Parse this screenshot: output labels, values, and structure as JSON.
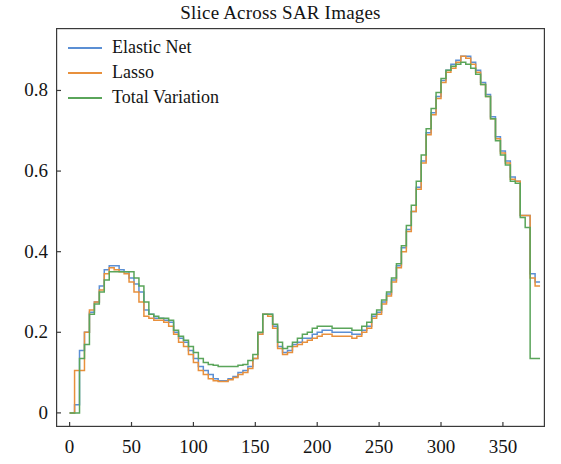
{
  "chart_data": {
    "type": "line",
    "title": "Slice Across SAR Images",
    "xlabel": "",
    "ylabel": "",
    "xlim": [
      -11,
      384
    ],
    "ylim": [
      -0.035,
      0.955
    ],
    "grid": false,
    "drawstyle": "steps-post",
    "legend_position": "upper left",
    "xticks": [
      0,
      50,
      100,
      150,
      200,
      250,
      300,
      350
    ],
    "xtick_labels": [
      "0",
      "50",
      "100",
      "150",
      "200",
      "250",
      "300",
      "350"
    ],
    "yticks": [
      0,
      0.2,
      0.4,
      0.6,
      0.8
    ],
    "ytick_labels": [
      "0",
      "0.2",
      "0.4",
      "0.6",
      "0.8"
    ],
    "colors": {
      "elastic_net": "#5b8fd4",
      "lasso": "#e8903c",
      "total_variation": "#5aa55a",
      "axis": "#3a3a3a",
      "text": "#141414"
    },
    "x": [
      0,
      4,
      8,
      12,
      16,
      20,
      24,
      28,
      32,
      36,
      40,
      44,
      48,
      52,
      56,
      60,
      64,
      68,
      72,
      76,
      80,
      84,
      88,
      92,
      96,
      100,
      104,
      108,
      112,
      116,
      120,
      124,
      128,
      132,
      136,
      140,
      144,
      148,
      152,
      156,
      160,
      164,
      168,
      172,
      176,
      180,
      184,
      188,
      192,
      196,
      200,
      204,
      208,
      212,
      216,
      220,
      224,
      228,
      232,
      236,
      240,
      244,
      248,
      252,
      256,
      260,
      264,
      268,
      272,
      276,
      280,
      284,
      288,
      292,
      296,
      300,
      304,
      308,
      312,
      316,
      320,
      324,
      328,
      332,
      336,
      340,
      344,
      348,
      352,
      356,
      360,
      364,
      368,
      372,
      376
    ],
    "series": [
      {
        "name": "Elastic Net",
        "color": "#5b8fd4",
        "values": [
          0.0,
          0.02,
          0.155,
          0.2,
          0.25,
          0.275,
          0.315,
          0.355,
          0.365,
          0.365,
          0.355,
          0.35,
          0.335,
          0.32,
          0.3,
          0.255,
          0.245,
          0.235,
          0.235,
          0.23,
          0.225,
          0.2,
          0.185,
          0.175,
          0.155,
          0.135,
          0.115,
          0.105,
          0.095,
          0.085,
          0.08,
          0.08,
          0.085,
          0.09,
          0.1,
          0.105,
          0.115,
          0.135,
          0.195,
          0.245,
          0.245,
          0.215,
          0.165,
          0.15,
          0.155,
          0.17,
          0.175,
          0.185,
          0.185,
          0.195,
          0.2,
          0.205,
          0.205,
          0.2,
          0.2,
          0.2,
          0.2,
          0.195,
          0.195,
          0.205,
          0.215,
          0.24,
          0.25,
          0.275,
          0.295,
          0.33,
          0.365,
          0.41,
          0.455,
          0.5,
          0.56,
          0.625,
          0.695,
          0.745,
          0.785,
          0.825,
          0.85,
          0.865,
          0.875,
          0.885,
          0.885,
          0.87,
          0.85,
          0.82,
          0.79,
          0.735,
          0.685,
          0.65,
          0.625,
          0.585,
          0.575,
          0.49,
          0.49,
          0.345,
          0.325
        ]
      },
      {
        "name": "Lasso",
        "color": "#e8903c",
        "values": [
          0.0,
          0.105,
          0.105,
          0.2,
          0.255,
          0.275,
          0.305,
          0.345,
          0.36,
          0.355,
          0.35,
          0.345,
          0.325,
          0.3,
          0.275,
          0.24,
          0.235,
          0.23,
          0.23,
          0.225,
          0.215,
          0.195,
          0.175,
          0.165,
          0.145,
          0.125,
          0.105,
          0.095,
          0.085,
          0.08,
          0.078,
          0.078,
          0.082,
          0.088,
          0.095,
          0.1,
          0.11,
          0.135,
          0.195,
          0.245,
          0.24,
          0.21,
          0.16,
          0.145,
          0.15,
          0.165,
          0.17,
          0.175,
          0.18,
          0.185,
          0.19,
          0.195,
          0.195,
          0.19,
          0.19,
          0.19,
          0.19,
          0.185,
          0.19,
          0.2,
          0.21,
          0.235,
          0.245,
          0.27,
          0.29,
          0.325,
          0.36,
          0.4,
          0.45,
          0.5,
          0.555,
          0.62,
          0.69,
          0.74,
          0.78,
          0.82,
          0.845,
          0.855,
          0.87,
          0.885,
          0.88,
          0.865,
          0.845,
          0.815,
          0.785,
          0.73,
          0.68,
          0.645,
          0.62,
          0.58,
          0.575,
          0.49,
          0.49,
          0.335,
          0.315
        ]
      },
      {
        "name": "Total Variation",
        "color": "#5aa55a",
        "values": [
          0.0,
          0.0,
          0.135,
          0.17,
          0.245,
          0.27,
          0.3,
          0.33,
          0.35,
          0.35,
          0.35,
          0.35,
          0.35,
          0.335,
          0.315,
          0.275,
          0.245,
          0.24,
          0.235,
          0.235,
          0.23,
          0.205,
          0.19,
          0.18,
          0.165,
          0.15,
          0.135,
          0.125,
          0.12,
          0.118,
          0.115,
          0.115,
          0.115,
          0.115,
          0.118,
          0.12,
          0.13,
          0.145,
          0.2,
          0.245,
          0.245,
          0.22,
          0.175,
          0.16,
          0.165,
          0.175,
          0.185,
          0.195,
          0.2,
          0.21,
          0.215,
          0.215,
          0.215,
          0.21,
          0.21,
          0.21,
          0.21,
          0.205,
          0.205,
          0.215,
          0.225,
          0.245,
          0.255,
          0.28,
          0.3,
          0.335,
          0.37,
          0.415,
          0.465,
          0.515,
          0.575,
          0.64,
          0.705,
          0.755,
          0.795,
          0.83,
          0.85,
          0.86,
          0.865,
          0.87,
          0.865,
          0.855,
          0.84,
          0.815,
          0.785,
          0.73,
          0.675,
          0.64,
          0.615,
          0.575,
          0.57,
          0.485,
          0.46,
          0.135,
          0.135
        ]
      }
    ]
  },
  "legend": {
    "items": [
      {
        "label": "Elastic Net",
        "color": "#5b8fd4"
      },
      {
        "label": "Lasso",
        "color": "#e8903c"
      },
      {
        "label": "Total Variation",
        "color": "#5aa55a"
      }
    ]
  }
}
